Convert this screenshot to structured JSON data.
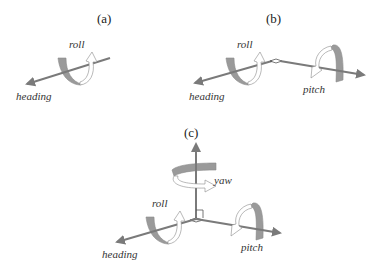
{
  "colors": {
    "axis": "#7a7a7a",
    "ribbon_dark": "#9a9a9a",
    "ribbon_light": "#ffffff",
    "ribbon_outline": "#8a8a8a",
    "text": "#333333"
  },
  "panels": [
    {
      "id": "a",
      "label": "(a)",
      "axes": [
        "heading"
      ],
      "rotations": [
        "roll"
      ]
    },
    {
      "id": "b",
      "label": "(b)",
      "axes": [
        "heading",
        "pitch"
      ],
      "rotations": [
        "roll",
        "pitch"
      ]
    },
    {
      "id": "c",
      "label": "(c)",
      "axes": [
        "heading",
        "pitch",
        "yaw"
      ],
      "rotations": [
        "roll",
        "pitch",
        "yaw"
      ]
    }
  ],
  "labels": {
    "a_panel": "(a)",
    "a_roll": "roll",
    "a_heading": "heading",
    "b_panel": "(b)",
    "b_roll": "roll",
    "b_heading": "heading",
    "b_pitch": "pitch",
    "c_panel": "(c)",
    "c_yaw": "yaw",
    "c_roll": "roll",
    "c_heading": "heading",
    "c_pitch": "pitch"
  }
}
